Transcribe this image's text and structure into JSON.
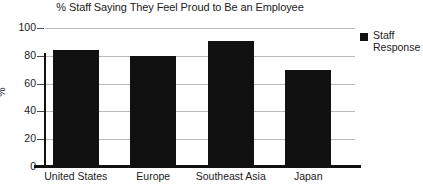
{
  "chart_data": {
    "type": "bar",
    "title": "% Staff Saying They Feel Proud to Be an Employee",
    "xlabel": "",
    "ylabel": "%",
    "categories": [
      "United States",
      "Europe",
      "Southeast Asia",
      "Japan"
    ],
    "values": [
      84,
      80,
      91,
      70
    ],
    "series": [
      {
        "name": "Staff Response",
        "values": [
          84,
          80,
          91,
          70
        ],
        "color": "#111111"
      }
    ],
    "ylim": [
      0,
      100
    ],
    "ytick_labels": [
      "100",
      "80",
      "60",
      "40",
      "20",
      "0"
    ],
    "ytick_values": [
      100,
      80,
      60,
      40,
      20,
      0
    ],
    "grid": true,
    "grid_color": "#b9b9b9",
    "legend": {
      "position": "right",
      "entries": [
        {
          "label_line1": "Staff",
          "label_line2": "Response",
          "color": "#111111"
        }
      ]
    }
  }
}
